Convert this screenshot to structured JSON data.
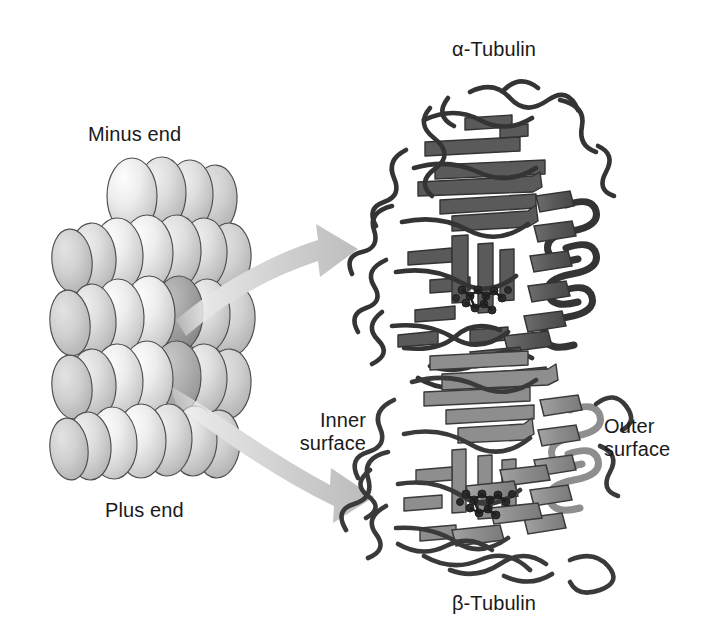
{
  "figure": {
    "kind": "scientific-diagram",
    "background_color": "#ffffff",
    "width": 704,
    "height": 638
  },
  "labels": {
    "minus_end": "Minus end",
    "plus_end": "Plus end",
    "alpha_tubulin": "α-Tubulin",
    "beta_tubulin": "β-Tubulin",
    "inner_surface": "Inner\nsurface",
    "outer_surface": "Outer\nsurface"
  },
  "microtubule": {
    "description": "Stacked rows of rounded globular tubulin subunits forming a short microtubule segment",
    "rows": 5,
    "columns_per_row": 4,
    "highlighted_subunit_label": "selected alpha-beta dimer",
    "colors": {
      "subunit_light": "#f2f2f2",
      "subunit_mid": "#d4d4d4",
      "subunit_shadow": "#b0b0b0",
      "subunit_highlight_dark": "#9a9a9a",
      "outline": "#4a4a4a"
    }
  },
  "arrows": {
    "count": 2,
    "style": "curved tapered gradient arrow",
    "color": "#c3c3c3",
    "upper_arrow_target": "alpha-tubulin subunit",
    "lower_arrow_target": "beta-tubulin subunit"
  },
  "ribbon": {
    "description": "Cartoon ribbon representation of the tubulin alpha-beta heterodimer",
    "alpha_color": "#5a5a5a",
    "beta_color": "#8e8e8e",
    "loop_color": "#3c3c3c",
    "ligand_label": "GTP / GDP nucleotide",
    "ligand_color": "#2e2e2e",
    "secondary_structure": [
      "beta-sheet arrows",
      "alpha-helix coils",
      "random coil loops"
    ]
  }
}
